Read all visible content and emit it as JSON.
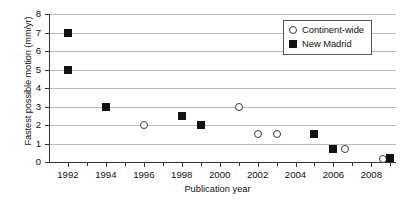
{
  "chart_data": {
    "type": "scatter",
    "title": "",
    "xlabel": "Publication year",
    "ylabel": "Fastest possible motion (mm/yr)",
    "xlim": [
      1991,
      2009.3
    ],
    "ylim": [
      0,
      8
    ],
    "xticks": [
      1992,
      1994,
      1996,
      1998,
      2000,
      2002,
      2004,
      2006,
      2008
    ],
    "xtick_labels": [
      "1992",
      "1994",
      "1996",
      "1998",
      "2000",
      "2002",
      "2004",
      "2006",
      "2008"
    ],
    "xminorticks": [
      1993,
      1995,
      1997,
      1999,
      2001,
      2003,
      2005,
      2007,
      2009
    ],
    "yticks": [
      0,
      1,
      2,
      3,
      4,
      5,
      6,
      7,
      8
    ],
    "ytick_labels": [
      "0",
      "1",
      "2",
      "3",
      "4",
      "5",
      "6",
      "7",
      "8"
    ],
    "grid": "horizontal",
    "legend_position": "upper-right",
    "series": [
      {
        "name": "Continent-wide",
        "marker": "open-circle",
        "color": "#3a3a3a",
        "points": [
          {
            "x": 1996,
            "y": 2.0
          },
          {
            "x": 2001,
            "y": 3.0
          },
          {
            "x": 2002,
            "y": 1.5
          },
          {
            "x": 2003,
            "y": 1.5
          },
          {
            "x": 2006.6,
            "y": 0.7
          },
          {
            "x": 2008.6,
            "y": 0.15
          }
        ]
      },
      {
        "name": "New Madrid",
        "marker": "filled-square",
        "color": "#111111",
        "points": [
          {
            "x": 1992,
            "y": 7.0
          },
          {
            "x": 1992,
            "y": 5.0
          },
          {
            "x": 1994,
            "y": 3.0
          },
          {
            "x": 1998,
            "y": 2.5
          },
          {
            "x": 1999,
            "y": 2.0
          },
          {
            "x": 2005,
            "y": 1.5
          },
          {
            "x": 2006,
            "y": 0.7
          },
          {
            "x": 2009,
            "y": 0.2
          }
        ]
      }
    ]
  },
  "legend": {
    "entries": [
      {
        "label": "Continent-wide",
        "marker": "open-circle"
      },
      {
        "label": "New Madrid",
        "marker": "filled-square"
      }
    ]
  }
}
